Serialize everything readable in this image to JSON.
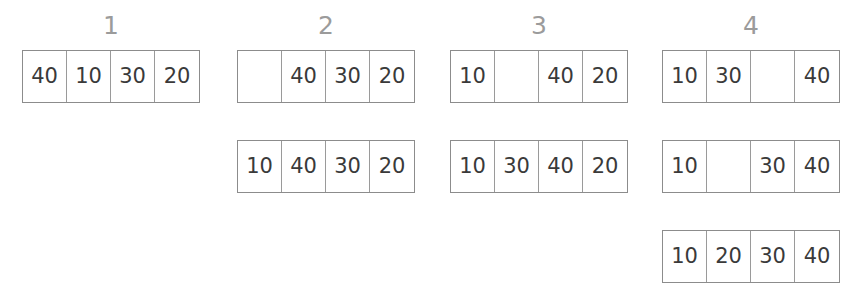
{
  "diagram": {
    "title_visible": false,
    "type": "insertion-sort-steps",
    "border_color": "#8c8c8c",
    "divider_color": "#9a9a9a",
    "text_color": "#3a3a3a",
    "label_color": "#9b9b9b",
    "background": "#ffffff"
  },
  "columns": [
    {
      "label": "1",
      "left": 22,
      "rows": [
        {
          "cells": [
            "40",
            "10",
            "30",
            "20"
          ]
        }
      ]
    },
    {
      "label": "2",
      "left": 237,
      "rows": [
        {
          "cells": [
            "",
            "40",
            "30",
            "20"
          ]
        },
        {
          "cells": [
            "10",
            "40",
            "30",
            "20"
          ]
        }
      ]
    },
    {
      "label": "3",
      "left": 450,
      "rows": [
        {
          "cells": [
            "10",
            "",
            "40",
            "20"
          ]
        },
        {
          "cells": [
            "10",
            "30",
            "40",
            "20"
          ]
        }
      ]
    },
    {
      "label": "4",
      "left": 662,
      "rows": [
        {
          "cells": [
            "10",
            "30",
            "",
            "40"
          ]
        },
        {
          "cells": [
            "10",
            "",
            "30",
            "40"
          ]
        },
        {
          "cells": [
            "10",
            "20",
            "30",
            "40"
          ]
        }
      ]
    }
  ],
  "chart_data": {
    "type": "table",
    "title": "",
    "xlabel": "",
    "ylabel": "",
    "categories": [
      "1",
      "2",
      "3",
      "4"
    ],
    "series": [
      {
        "name": "step 1 / pass 1",
        "values": [
          "40",
          "10",
          "30",
          "20"
        ]
      },
      {
        "name": "step 2 / pass 1",
        "values": [
          "",
          "40",
          "30",
          "20"
        ]
      },
      {
        "name": "step 2 / pass 2",
        "values": [
          "10",
          "40",
          "30",
          "20"
        ]
      },
      {
        "name": "step 3 / pass 1",
        "values": [
          "10",
          "",
          "40",
          "20"
        ]
      },
      {
        "name": "step 3 / pass 2",
        "values": [
          "10",
          "30",
          "40",
          "20"
        ]
      },
      {
        "name": "step 4 / pass 1",
        "values": [
          "10",
          "30",
          "",
          "40"
        ]
      },
      {
        "name": "step 4 / pass 2",
        "values": [
          "10",
          "",
          "30",
          "40"
        ]
      },
      {
        "name": "step 4 / pass 3",
        "values": [
          "10",
          "20",
          "30",
          "40"
        ]
      }
    ],
    "legend_position": "none",
    "grid": false
  }
}
